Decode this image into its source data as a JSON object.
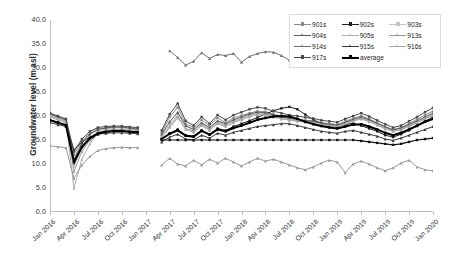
{
  "chart_data": {
    "type": "line",
    "title": "",
    "xlabel": "",
    "ylabel": "Groundwater level (m asl)",
    "ylim": [
      0.0,
      40.0
    ],
    "ytick_step": 5.0,
    "yticks": [
      "40.0",
      "35.0",
      "30.0",
      "25.0",
      "20.0",
      "15.0",
      "10.0",
      "5.0",
      "0.0"
    ],
    "xticks": [
      "Jan 2016",
      "Apr 2016",
      "Jul 2016",
      "Oct 2016",
      "Jan 2017",
      "Apr 2017",
      "Jul 2017",
      "Oct 2017",
      "Jan 2018",
      "Apr 2018",
      "Jul 2018",
      "Oct 2018",
      "Jan 2019",
      "Apr 2019",
      "Jul 2019",
      "Oct 2019",
      "Jan 2020"
    ],
    "xlim": [
      "Jan 2016",
      "Jan 2020"
    ],
    "grid": false,
    "legend_position": "top-right",
    "x_months": [
      "2016-01",
      "2016-02",
      "2016-03",
      "2016-04",
      "2016-05",
      "2016-06",
      "2016-07",
      "2016-08",
      "2016-09",
      "2016-10",
      "2016-11",
      "2016-12",
      "2017-01",
      "2017-02",
      "2017-03",
      "2017-04",
      "2017-05",
      "2017-06",
      "2017-07",
      "2017-08",
      "2017-09",
      "2017-10",
      "2017-11",
      "2017-12",
      "2018-01",
      "2018-02",
      "2018-03",
      "2018-04",
      "2018-05",
      "2018-06",
      "2018-07",
      "2018-08",
      "2018-09",
      "2018-10",
      "2018-11",
      "2018-12",
      "2019-01",
      "2019-02",
      "2019-03",
      "2019-04",
      "2019-05",
      "2019-06",
      "2019-07",
      "2019-08",
      "2019-09",
      "2019-10",
      "2019-11",
      "2019-12",
      "2020-01"
    ],
    "series": [
      {
        "name": "901s",
        "color": "#8c8c8c",
        "width": 1.0,
        "marker": "square",
        "values": [
          20.3,
          19.6,
          19.0,
          12.0,
          14.8,
          16.4,
          17.3,
          17.5,
          17.6,
          17.6,
          17.3,
          17.1,
          null,
          null,
          16.5,
          19.8,
          21.8,
          18.4,
          17.6,
          19.2,
          18.0,
          19.6,
          18.6,
          19.6,
          20.1,
          20.6,
          21.0,
          20.9,
          20.4,
          20.0,
          19.6,
          19.4,
          19.1,
          19.0,
          18.6,
          18.4,
          18.2,
          18.9,
          19.5,
          20.0,
          19.4,
          18.6,
          17.8,
          17.2,
          17.6,
          18.4,
          19.3,
          20.2,
          21.0
        ]
      },
      {
        "name": "902s",
        "color": "#1f1f1f",
        "width": 1.0,
        "marker": "square",
        "values": [
          19.2,
          18.7,
          18.1,
          10.0,
          13.2,
          15.0,
          16.2,
          16.6,
          16.8,
          16.9,
          16.7,
          16.6,
          null,
          null,
          15.2,
          16.4,
          17.2,
          16.0,
          15.8,
          17.0,
          16.2,
          17.4,
          17.0,
          17.8,
          18.4,
          19.0,
          19.7,
          20.4,
          21.1,
          21.6,
          21.9,
          21.4,
          20.3,
          19.2,
          18.5,
          18.0,
          17.8,
          18.2,
          18.5,
          18.0,
          17.4,
          16.8,
          16.0,
          15.6,
          16.2,
          17.0,
          17.9,
          18.9,
          19.8
        ]
      },
      {
        "name": "903s",
        "color": "#c4c4c4",
        "width": 1.0,
        "marker": "square",
        "values": [
          20.0,
          19.4,
          18.8,
          9.4,
          13.0,
          15.4,
          16.9,
          17.3,
          17.5,
          17.5,
          17.3,
          17.2,
          null,
          null,
          16.0,
          18.2,
          20.4,
          17.8,
          17.0,
          18.4,
          17.4,
          18.8,
          18.2,
          19.0,
          19.6,
          20.2,
          20.6,
          20.5,
          20.1,
          19.7,
          19.4,
          19.2,
          19.0,
          18.8,
          18.4,
          18.2,
          18.0,
          18.6,
          19.2,
          19.6,
          19.1,
          18.4,
          17.6,
          17.0,
          17.4,
          18.0,
          18.8,
          19.6,
          20.3
        ]
      },
      {
        "name": "904s",
        "color": "#5a5a5a",
        "width": 1.0,
        "marker": "triangle",
        "values": [
          20.4,
          19.8,
          19.2,
          11.0,
          14.4,
          16.2,
          17.2,
          17.5,
          17.7,
          17.7,
          17.5,
          17.3,
          null,
          null,
          16.2,
          18.8,
          20.8,
          18.0,
          17.2,
          18.6,
          17.6,
          19.0,
          18.4,
          19.2,
          19.8,
          20.4,
          20.8,
          20.7,
          20.2,
          19.8,
          19.5,
          19.3,
          19.0,
          18.9,
          18.5,
          18.3,
          18.1,
          18.7,
          19.3,
          19.8,
          19.2,
          18.5,
          17.7,
          17.1,
          17.5,
          18.2,
          19.0,
          19.8,
          20.6
        ]
      },
      {
        "name": "905s",
        "color": "#b0b0b0",
        "width": 1.0,
        "marker": "triangle",
        "values": [
          20.1,
          19.5,
          18.9,
          5.0,
          11.0,
          14.2,
          16.4,
          17.0,
          17.2,
          17.2,
          17.0,
          16.9,
          null,
          null,
          15.4,
          17.6,
          19.6,
          17.2,
          16.6,
          18.0,
          17.0,
          18.4,
          17.8,
          18.6,
          19.2,
          19.8,
          20.3,
          20.2,
          19.8,
          19.4,
          19.1,
          18.9,
          18.7,
          18.5,
          18.1,
          17.9,
          17.7,
          18.3,
          18.9,
          19.4,
          18.8,
          18.1,
          17.3,
          16.8,
          17.1,
          17.8,
          18.6,
          19.4,
          20.1
        ]
      },
      {
        "name": "913s",
        "color": "#9a9a9a",
        "width": 1.0,
        "marker": "triangle",
        "values": [
          13.8,
          13.6,
          13.4,
          7.0,
          9.8,
          11.6,
          12.8,
          13.2,
          13.4,
          13.5,
          13.4,
          13.4,
          null,
          null,
          9.8,
          11.2,
          10.0,
          9.6,
          10.8,
          9.8,
          11.0,
          10.2,
          11.2,
          10.4,
          9.6,
          10.4,
          11.2,
          10.6,
          11.0,
          10.4,
          9.8,
          9.2,
          8.8,
          9.4,
          10.2,
          10.8,
          10.4,
          8.2,
          10.0,
          10.6,
          10.0,
          9.2,
          8.6,
          9.2,
          10.2,
          10.8,
          9.4,
          8.8,
          8.6
        ]
      },
      {
        "name": "914s",
        "color": "#6e6e6e",
        "width": 1.0,
        "marker": "triangle",
        "values": [
          null,
          null,
          null,
          null,
          null,
          null,
          null,
          null,
          null,
          null,
          null,
          null,
          null,
          null,
          null,
          33.6,
          32.2,
          30.6,
          31.4,
          33.2,
          32.0,
          32.8,
          32.6,
          33.0,
          31.2,
          32.4,
          33.0,
          33.4,
          33.3,
          32.6,
          31.6,
          31.2,
          null,
          null,
          null,
          null,
          null,
          null,
          null,
          null,
          null,
          null,
          null,
          null,
          null,
          null,
          null,
          null,
          null
        ]
      },
      {
        "name": "915s",
        "color": "#3a3a3a",
        "width": 1.0,
        "marker": "triangle",
        "values": [
          18.6,
          18.2,
          17.8,
          13.0,
          14.6,
          15.6,
          16.2,
          16.4,
          16.5,
          16.5,
          16.4,
          16.3,
          null,
          null,
          14.6,
          15.6,
          16.2,
          15.2,
          15.0,
          16.0,
          15.4,
          16.4,
          16.0,
          16.6,
          17.0,
          17.4,
          17.8,
          18.0,
          18.2,
          18.4,
          18.4,
          18.0,
          17.6,
          17.2,
          16.8,
          16.6,
          16.4,
          16.8,
          17.0,
          16.6,
          16.2,
          15.8,
          15.2,
          14.9,
          15.4,
          16.0,
          16.6,
          17.2,
          17.8
        ]
      },
      {
        "name": "916s",
        "color": "#a6a6a6",
        "width": 1.0,
        "marker": "triangle",
        "values": [
          19.8,
          19.2,
          18.6,
          8.4,
          12.6,
          15.0,
          16.6,
          17.0,
          17.2,
          17.2,
          17.0,
          16.9,
          null,
          null,
          15.8,
          17.8,
          20.0,
          17.4,
          16.8,
          18.2,
          17.2,
          18.6,
          18.0,
          18.8,
          19.4,
          20.0,
          20.4,
          20.3,
          19.9,
          19.5,
          19.2,
          19.0,
          18.8,
          18.6,
          18.2,
          18.0,
          17.8,
          18.4,
          19.0,
          19.5,
          18.9,
          18.2,
          17.4,
          16.9,
          17.2,
          17.9,
          18.7,
          19.5,
          20.2
        ]
      },
      {
        "name": "917s",
        "color": "#4a4a4a",
        "width": 1.0,
        "marker": "square",
        "values": [
          20.6,
          20.0,
          19.4,
          12.6,
          15.2,
          16.8,
          17.6,
          17.8,
          17.9,
          17.9,
          17.7,
          17.6,
          null,
          null,
          17.0,
          20.4,
          22.6,
          19.0,
          18.0,
          19.8,
          18.4,
          20.2,
          19.2,
          20.2,
          20.8,
          21.4,
          21.8,
          21.6,
          21.0,
          20.6,
          20.2,
          20.0,
          19.7,
          19.5,
          19.1,
          18.9,
          18.7,
          19.4,
          20.0,
          20.6,
          19.9,
          19.1,
          18.3,
          17.6,
          18.0,
          18.9,
          19.8,
          20.8,
          21.7
        ]
      },
      {
        "name": "average",
        "color": "#000000",
        "width": 2.0,
        "marker": "square",
        "values": [
          19.1,
          18.6,
          18.1,
          10.4,
          13.6,
          15.4,
          16.4,
          16.7,
          16.9,
          16.9,
          16.7,
          16.6,
          null,
          null,
          15.2,
          16.3,
          17.0,
          15.9,
          15.7,
          16.9,
          16.1,
          17.2,
          16.8,
          17.5,
          18.0,
          18.6,
          19.2,
          19.6,
          19.9,
          20.0,
          19.9,
          19.4,
          18.8,
          18.3,
          17.9,
          17.6,
          17.4,
          17.8,
          18.2,
          18.3,
          17.8,
          17.2,
          16.5,
          16.0,
          16.5,
          17.2,
          18.0,
          18.8,
          19.4
        ]
      },
      {
        "name": "flat-low",
        "color": "#141414",
        "width": 1.2,
        "marker": "square",
        "legend_hidden": true,
        "values": [
          null,
          null,
          null,
          null,
          null,
          null,
          null,
          null,
          null,
          null,
          null,
          null,
          null,
          null,
          15.0,
          15.0,
          15.0,
          15.0,
          15.0,
          15.0,
          15.0,
          15.0,
          15.0,
          15.0,
          15.0,
          15.0,
          15.0,
          15.0,
          15.0,
          15.0,
          15.0,
          15.0,
          15.0,
          15.0,
          15.0,
          15.0,
          15.0,
          15.0,
          15.0,
          14.8,
          14.6,
          14.4,
          14.2,
          14.0,
          14.2,
          14.6,
          15.0,
          15.2,
          15.4
        ]
      }
    ]
  },
  "legend": {
    "rows": [
      [
        {
          "label": "901s",
          "color": "#8c8c8c",
          "marker": "square"
        },
        {
          "label": "902s",
          "color": "#1f1f1f",
          "marker": "square"
        },
        {
          "label": "903s",
          "color": "#c4c4c4",
          "marker": "square"
        }
      ],
      [
        {
          "label": "904s",
          "color": "#5a5a5a",
          "marker": "triangle"
        },
        {
          "label": "905s",
          "color": "#b0b0b0",
          "marker": "triangle"
        },
        {
          "label": "913s",
          "color": "#9a9a9a",
          "marker": "triangle"
        }
      ],
      [
        {
          "label": "914s",
          "color": "#6e6e6e",
          "marker": "triangle"
        },
        {
          "label": "915s",
          "color": "#3a3a3a",
          "marker": "triangle"
        },
        {
          "label": "916s",
          "color": "#a6a6a6",
          "marker": "triangle"
        }
      ],
      [
        {
          "label": "917s",
          "color": "#4a4a4a",
          "marker": "square"
        },
        {
          "label": "average",
          "color": "#000000",
          "marker": "square",
          "wide": true
        }
      ]
    ]
  },
  "colors": {
    "axis": "#bfbfbf",
    "tick_text": "#3b3b3b",
    "title_text": "#2a2a2a",
    "plot_background": "#ffffff",
    "legend_border": "#dcdcdc"
  }
}
